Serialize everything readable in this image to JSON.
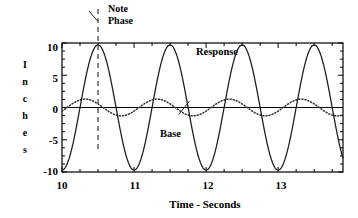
{
  "chart_data": {
    "type": "line",
    "title": "",
    "subtitle": "",
    "xlabel": "Time - Seconds",
    "ylabel": "Inches",
    "ylabel_letters": [
      "I",
      "n",
      "c",
      "h",
      "e",
      "s"
    ],
    "xlim": [
      10,
      13.9
    ],
    "ylim": [
      -10,
      10
    ],
    "xticks": [
      10,
      11,
      12,
      13
    ],
    "xtick_labels": [
      "10",
      "11",
      "12",
      "13"
    ],
    "yticks": [
      10,
      5,
      0,
      -5,
      -10
    ],
    "ytick_labels": [
      "10",
      "5",
      "0",
      "-5",
      "-10"
    ],
    "x_minor_tick_step": 0.25,
    "y_minor_tick_step": 1.25,
    "grid": false,
    "legend_position": "inline-annotations",
    "zero_line": true,
    "series": [
      {
        "name": "Response",
        "style": "solid",
        "color": "#1a1a1a",
        "amplitude": 9.7,
        "period": 1.0,
        "phase_peak_time": 10.5,
        "offset": 0,
        "x": [
          10.0,
          10.05,
          10.1,
          10.15,
          10.2,
          10.25,
          10.3,
          10.35,
          10.4,
          10.45,
          10.5,
          10.55,
          10.6,
          10.65,
          10.7,
          10.75,
          10.8,
          10.85,
          10.9,
          10.95,
          11.0,
          11.05,
          11.1,
          11.15,
          11.2,
          11.25,
          11.3,
          11.35,
          11.4,
          11.45,
          11.5,
          11.55,
          11.6,
          11.65,
          11.7,
          11.75,
          11.8,
          11.85,
          11.9,
          11.95,
          12.0,
          12.05,
          12.1,
          12.15,
          12.2,
          12.25,
          12.3,
          12.35,
          12.4,
          12.45,
          12.5,
          12.55,
          12.6,
          12.65,
          12.7,
          12.75,
          12.8,
          12.85,
          12.9,
          12.95,
          13.0,
          13.05,
          13.1,
          13.15,
          13.2,
          13.25,
          13.3,
          13.35,
          13.4,
          13.45,
          13.5,
          13.55,
          13.6,
          13.65,
          13.7,
          13.75,
          13.8,
          13.85,
          13.9
        ],
        "y": [
          -9.7,
          -9.5,
          -8.9,
          -7.9,
          -6.6,
          -5.0,
          -3.2,
          -1.3,
          0.7,
          2.6,
          9.7,
          9.4,
          8.6,
          7.4,
          5.8,
          3.9,
          1.9,
          -0.2,
          -2.2,
          -4.1,
          -9.7,
          -9.5,
          -8.9,
          -7.9,
          -6.6,
          -5.0,
          -3.2,
          -1.3,
          0.7,
          2.6,
          9.7,
          9.4,
          8.6,
          7.4,
          5.8,
          3.9,
          1.9,
          -0.2,
          -2.2,
          -4.1,
          -9.7,
          -9.5,
          -8.9,
          -7.9,
          -6.6,
          -5.0,
          -3.2,
          -1.3,
          0.7,
          2.6,
          9.7,
          9.4,
          8.6,
          7.4,
          5.8,
          3.9,
          1.9,
          -0.2,
          -2.2,
          -4.1,
          -9.7,
          -9.5,
          -8.9,
          -7.9,
          -6.6,
          -5.0,
          -3.2,
          -1.3,
          0.7,
          2.6,
          9.7,
          9.4,
          8.6,
          7.4,
          5.8,
          3.9,
          1.9,
          -0.2,
          -8.8
        ]
      },
      {
        "name": "Base",
        "style": "dotted",
        "color": "#333333",
        "amplitude": 1.3,
        "period": 1.0,
        "phase_peak_time": 10.32,
        "offset": 0
      }
    ],
    "annotations": [
      {
        "id": "note-phase",
        "text_lines": [
          "Note",
          "Phase"
        ],
        "pointer_to_x": 10.5,
        "pointer_to_y": 10,
        "style": "leader-line"
      },
      {
        "id": "response",
        "text": "Response",
        "points_to_series": "Response"
      },
      {
        "id": "base",
        "text": "Base",
        "points_to_series": "Base",
        "style": "leader-line"
      }
    ],
    "marker_lines": [
      {
        "id": "note-phase-marker",
        "orientation": "vertical",
        "x": 10.5,
        "style": "dashed",
        "color": "#555555"
      }
    ]
  },
  "axis": {
    "frame_color": "#000000",
    "tick_color": "#000000"
  }
}
